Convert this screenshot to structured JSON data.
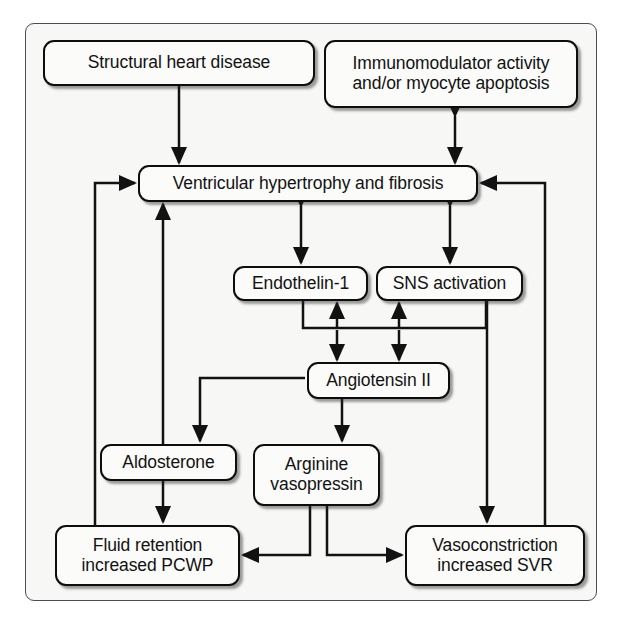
{
  "diagram": {
    "frame": {
      "border_color": "#4c4c4c",
      "fill_color": "#f7f7f5"
    },
    "style": {
      "node_border_color": "#0d0d0d",
      "node_fill_color": "#fbfbfa",
      "edge_color": "#121212",
      "text_color": "#121212"
    },
    "nodes": [
      {
        "id": "structural-heart-disease",
        "label": "Structural heart disease",
        "lines": [
          "Structural heart disease"
        ],
        "x": 43,
        "y": 40,
        "w": 272,
        "h": 46
      },
      {
        "id": "immunomodulator-activity",
        "label": "Immunomodulator activity and/or myocyte apoptosis",
        "lines": [
          "Immunomodulator activity",
          "and/or myocyte apoptosis"
        ],
        "x": 324,
        "y": 40,
        "w": 254,
        "h": 68
      },
      {
        "id": "ventricular-hypertrophy-fibrosis",
        "label": "Ventricular hypertrophy and fibrosis",
        "lines": [
          "Ventricular hypertrophy and fibrosis"
        ],
        "x": 138,
        "y": 165,
        "w": 340,
        "h": 37
      },
      {
        "id": "endothelin-1",
        "label": "Endothelin-1",
        "lines": [
          "Endothelin-1"
        ],
        "x": 233,
        "y": 266,
        "w": 135,
        "h": 35
      },
      {
        "id": "sns-activation",
        "label": "SNS activation",
        "lines": [
          "SNS activation"
        ],
        "x": 376,
        "y": 266,
        "w": 147,
        "h": 35
      },
      {
        "id": "angiotensin-ii",
        "label": "Angiotensin II",
        "lines": [
          "Angiotensin II"
        ],
        "x": 307,
        "y": 362,
        "w": 143,
        "h": 37
      },
      {
        "id": "aldosterone",
        "label": "Aldosterone",
        "lines": [
          "Aldosterone"
        ],
        "x": 100,
        "y": 444,
        "w": 137,
        "h": 37
      },
      {
        "id": "arginine-vasopressin",
        "label": "Arginine vasopressin",
        "lines": [
          "Arginine",
          "vasopressin"
        ],
        "x": 253,
        "y": 444,
        "w": 127,
        "h": 62
      },
      {
        "id": "fluid-retention-increased-pcwp",
        "label": "Fluid retention increased PCWP",
        "lines": [
          "Fluid retention",
          "increased PCWP"
        ],
        "x": 55,
        "y": 525,
        "w": 185,
        "h": 61
      },
      {
        "id": "vasoconstriction-increased-svr",
        "label": "Vasoconstriction increased SVR",
        "lines": [
          "Vasoconstriction",
          "increased SVR"
        ],
        "x": 405,
        "y": 525,
        "w": 180,
        "h": 61
      }
    ],
    "edges": [
      {
        "id": "edge-structural-to-ventricular",
        "from": "structural-heart-disease",
        "to": "ventricular-hypertrophy-fibrosis",
        "direction": "one-way"
      },
      {
        "id": "edge-immunomodulator-ventricular",
        "from": "immunomodulator-activity",
        "to": "ventricular-hypertrophy-fibrosis",
        "direction": "bidirectional"
      },
      {
        "id": "edge-ventricular-endothelin",
        "from": "ventricular-hypertrophy-fibrosis",
        "to": "endothelin-1",
        "direction": "bidirectional"
      },
      {
        "id": "edge-ventricular-sns",
        "from": "ventricular-hypertrophy-fibrosis",
        "to": "sns-activation",
        "direction": "bidirectional"
      },
      {
        "id": "edge-endothelin-angiotensin",
        "from": "endothelin-1",
        "to": "angiotensin-ii",
        "direction": "bidirectional"
      },
      {
        "id": "edge-sns-angiotensin",
        "from": "sns-activation",
        "to": "angiotensin-ii",
        "direction": "bidirectional"
      },
      {
        "id": "edge-angiotensin-aldosterone",
        "from": "angiotensin-ii",
        "to": "aldosterone",
        "direction": "one-way"
      },
      {
        "id": "edge-angiotensin-vasopressin",
        "from": "angiotensin-ii",
        "to": "arginine-vasopressin",
        "direction": "one-way"
      },
      {
        "id": "edge-aldosterone-fluid",
        "from": "aldosterone",
        "to": "fluid-retention-increased-pcwp",
        "direction": "one-way"
      },
      {
        "id": "edge-vasopressin-fluid",
        "from": "arginine-vasopressin",
        "to": "fluid-retention-increased-pcwp",
        "direction": "one-way"
      },
      {
        "id": "edge-vasopressin-vasoconstriction",
        "from": "arginine-vasopressin",
        "to": "vasoconstriction-increased-svr",
        "direction": "one-way"
      },
      {
        "id": "edge-aldosterone-ventricular",
        "from": "aldosterone",
        "to": "ventricular-hypertrophy-fibrosis",
        "direction": "one-way"
      },
      {
        "id": "edge-fluid-ventricular",
        "from": "fluid-retention-increased-pcwp",
        "to": "ventricular-hypertrophy-fibrosis",
        "direction": "one-way"
      },
      {
        "id": "edge-sns-vasoconstriction",
        "from": "sns-activation",
        "to": "vasoconstriction-increased-svr",
        "direction": "one-way"
      },
      {
        "id": "edge-vasoconstriction-ventricular",
        "from": "vasoconstriction-increased-svr",
        "to": "ventricular-hypertrophy-fibrosis",
        "direction": "one-way"
      }
    ]
  }
}
